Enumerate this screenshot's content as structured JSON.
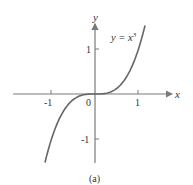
{
  "chart_data": {
    "type": "line",
    "title": "",
    "caption": "(a)",
    "xlabel": "x",
    "ylabel": "y",
    "xlim": [
      -1.9,
      1.8
    ],
    "ylim": [
      -1.55,
      1.8
    ],
    "grid": false,
    "x_ticks": [
      -1,
      1
    ],
    "x_tick_labels": [
      "-1",
      "1"
    ],
    "y_ticks": [
      -1,
      1
    ],
    "y_tick_labels": [
      "-1",
      "1"
    ],
    "origin_label": "0",
    "series": [
      {
        "name": "y = x^3",
        "function": "x^3",
        "x_range": [
          -1.15,
          1.15
        ],
        "x": [
          -1.15,
          -1.0,
          -0.8,
          -0.6,
          -0.4,
          -0.2,
          0,
          0.2,
          0.4,
          0.6,
          0.8,
          1.0,
          1.15
        ],
        "y": [
          -1.52,
          -1.0,
          -0.512,
          -0.216,
          -0.064,
          -0.008,
          0,
          0.008,
          0.064,
          0.216,
          0.512,
          1.0,
          1.52
        ]
      }
    ],
    "annotations": [
      {
        "text": "y = x",
        "superscript": "3",
        "near": [
          0.85,
          1.4
        ]
      }
    ]
  },
  "colors": {
    "curve": "#666666",
    "axis": "#7a7a7a",
    "text": "#333333"
  }
}
